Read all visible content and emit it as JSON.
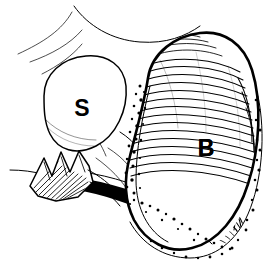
{
  "figure": {
    "kind": "anatomical-line-illustration",
    "style": "pen-and-ink engraving with hatching and stippling",
    "background_color": "#ffffff",
    "ink_color": "#000000",
    "width": 279,
    "height": 272,
    "alt_text": "Black and white line drawing of two adjacent anatomical structures labelled S and B",
    "labels": [
      {
        "id": "label-s",
        "text": "S",
        "meaning": "structure-s",
        "x": 82,
        "y": 108,
        "font_size": 23,
        "weight": "bold",
        "color": "#000000"
      },
      {
        "id": "label-b",
        "text": "B",
        "meaning": "structure-b",
        "x": 206,
        "y": 148,
        "font_size": 23,
        "weight": "bold",
        "color": "#000000"
      }
    ],
    "structures": [
      {
        "id": "structure-s",
        "name": "oval-unshaded-organ",
        "label": "S",
        "shading": "none",
        "outline": "closed teardrop oval, upper left quadrant"
      },
      {
        "id": "structure-b",
        "name": "large-hatched-organ",
        "label": "B",
        "shading": "dense curved hatching with concentric swirl at base",
        "outline": "large bean shape occupying right two thirds"
      },
      {
        "id": "cut-tissue",
        "name": "jagged-cut-edge",
        "label": "",
        "shading": "fine dark shading strokes",
        "outline": "claw-like torn tissue at lower left"
      },
      {
        "id": "duct-band",
        "name": "dark-duct-band",
        "label": "",
        "shading": "solid black band",
        "outline": "sweeps from lower left into base of structure B"
      },
      {
        "id": "fascia-lines",
        "name": "surrounding-contour-lines",
        "label": "",
        "shading": "none",
        "outline": "thin sweeping lines across upper left"
      },
      {
        "id": "stipple-rim",
        "name": "stippled-fat-border",
        "label": "",
        "shading": "stipple dots",
        "outline": "granular border tracing left and outer margin of structure B"
      }
    ]
  }
}
